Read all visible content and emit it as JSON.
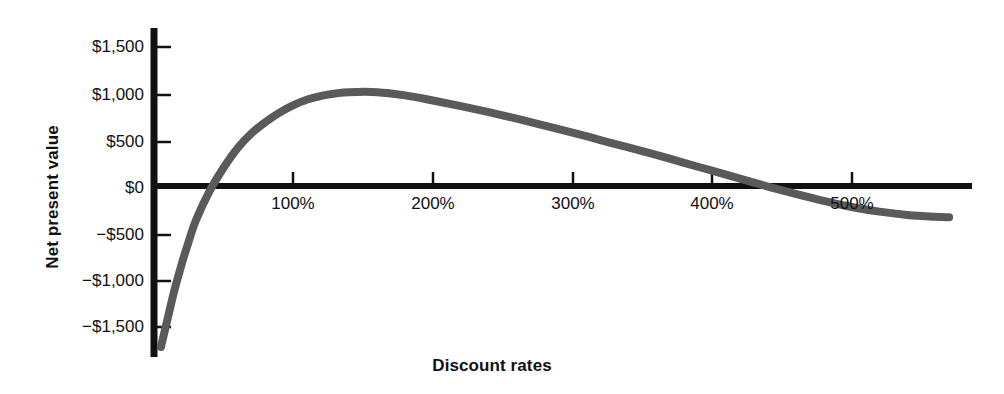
{
  "chart_data": {
    "type": "line",
    "title": "",
    "xlabel": "Discount rates",
    "ylabel": "Net present value",
    "xlim": [
      -10,
      590
    ],
    "ylim": [
      -1750,
      1750
    ],
    "grid": false,
    "legend": null,
    "x_tick_labels": [
      "100%",
      "200%",
      "300%",
      "400%",
      "500%"
    ],
    "x_tick_values": [
      100,
      200,
      300,
      400,
      500
    ],
    "y_tick_labels": [
      "$1,500",
      "$1,000",
      "$500",
      "$0",
      "−$500",
      "−$1,000",
      "−$1,500"
    ],
    "y_tick_values": [
      1500,
      1000,
      500,
      0,
      -500,
      -1000,
      -1500
    ],
    "series": [
      {
        "name": "Net present value",
        "color": "#5a5a5a",
        "x": [
          5,
          10,
          15,
          20,
          25,
          30,
          40,
          50,
          60,
          70,
          80,
          90,
          100,
          110,
          120,
          130,
          140,
          160,
          180,
          200,
          220,
          240,
          260,
          280,
          300,
          320,
          340,
          360,
          380,
          400,
          420,
          440,
          460,
          480,
          500,
          520,
          540,
          560,
          570
        ],
        "y": [
          -1720,
          -1400,
          -1090,
          -820,
          -580,
          -360,
          -40,
          210,
          420,
          580,
          700,
          800,
          880,
          940,
          980,
          1005,
          1020,
          1020,
          985,
          930,
          870,
          805,
          735,
          660,
          585,
          505,
          425,
          345,
          260,
          175,
          90,
          5,
          -75,
          -150,
          -215,
          -265,
          -300,
          -320,
          -325
        ]
      }
    ],
    "annotations": []
  },
  "axes": {
    "y_axis_name": "value-axis",
    "x_axis_name": "category-axis"
  }
}
